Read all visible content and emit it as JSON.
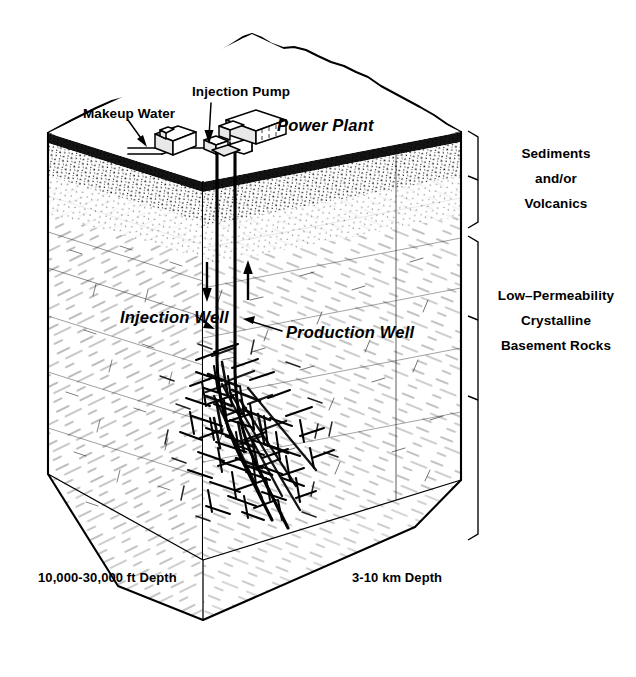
{
  "figure": {
    "style": "black-and-white line art, isometric cutaway block",
    "background_color": "#ffffff",
    "line_color": "#000000"
  },
  "surface_labels": {
    "makeup_water": "Makeup Water",
    "injection_pump": "Injection Pump",
    "power_plant": "Power Plant"
  },
  "well_labels": {
    "injection_well": "Injection Well",
    "production_well": "Production Well"
  },
  "strata_labels": {
    "upper": {
      "line1": "Sediments",
      "line2": "and/or",
      "line3": "Volcanics"
    },
    "lower": {
      "line1": "Low–Permeability",
      "line2": "Crystalline",
      "line3": "Basement Rocks"
    }
  },
  "depth_labels": {
    "imperial": "10,000-30,000 ft Depth",
    "metric": "3-10 km Depth"
  },
  "flow_arrows": {
    "injection_direction": "down",
    "production_direction": "up"
  },
  "icons": {
    "makeup_water_pointer": "arrow-icon",
    "injection_pump_pointer": "arrow-icon",
    "injection_well_pointer": "arrow-icon",
    "production_well_pointer": "arrow-icon",
    "down_flow": "arrow-down-icon",
    "up_flow": "arrow-up-icon",
    "pump_building": "building-icon",
    "plant_building": "building-icon",
    "upper_strata_bracket": "bracket-icon",
    "lower_strata_bracket": "bracket-icon"
  }
}
